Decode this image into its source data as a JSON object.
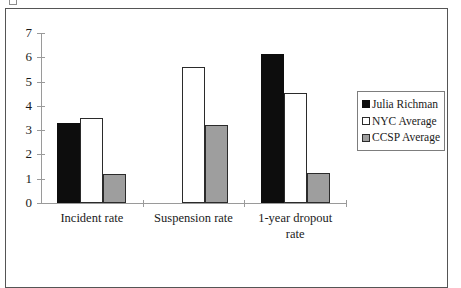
{
  "chart_data": {
    "type": "bar",
    "title": "",
    "xlabel": "",
    "ylabel": "",
    "ylim": [
      0,
      7
    ],
    "ytick_labels": [
      "0",
      "1",
      "2",
      "3",
      "4",
      "5",
      "6",
      "7"
    ],
    "grid": false,
    "legend_position": "right",
    "categories": [
      "Incident rate",
      "Suspension rate",
      "1-year dropout rate"
    ],
    "category_lines": [
      [
        "Incident rate"
      ],
      [
        "Suspension rate"
      ],
      [
        "1-year dropout",
        "rate"
      ]
    ],
    "series": [
      {
        "name": "Julia Richman",
        "color": "#0d0d0d",
        "values": [
          3.3,
          null,
          6.15
        ]
      },
      {
        "name": "NYC Average",
        "color": "#ffffff",
        "values": [
          3.5,
          5.6,
          4.55
        ]
      },
      {
        "name": "CCSP Average",
        "color": "#9e9e9e",
        "values": [
          1.2,
          3.2,
          1.25
        ]
      }
    ]
  }
}
